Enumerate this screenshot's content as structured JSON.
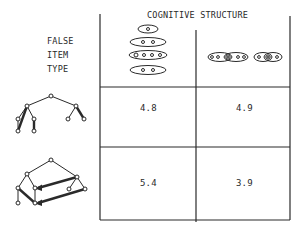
{
  "header": {
    "title": "COGNITIVE STRUCTURE"
  },
  "row_label": {
    "lines": [
      "FALSE",
      "ITEM",
      "TYPE"
    ]
  },
  "columns": [
    {
      "id": "hierarchical",
      "icon": "nested-ellipses-icon",
      "description": "stacked ellipses containing 1, 2, 4, 2 items"
    },
    {
      "id": "overlapping",
      "icon": "overlapping-ellipses-icon",
      "description": "chains of overlapping ellipses"
    }
  ],
  "rows": [
    {
      "id": "simple-tree",
      "icon": "tree-diagram-icon",
      "values": [
        "4.8",
        "4.9"
      ]
    },
    {
      "id": "tree-with-links",
      "icon": "tree-with-cross-links-icon",
      "values": [
        "5.4",
        "3.9"
      ]
    }
  ],
  "colors": {
    "ink": "#2a2a2a",
    "background": "#ffffff"
  }
}
